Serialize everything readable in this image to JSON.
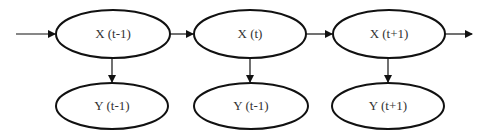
{
  "diagram": {
    "type": "dynamic-bayesian-network",
    "colors": {
      "stroke": "#111111",
      "text": "#333333",
      "background": "#ffffff"
    },
    "nodes": [
      {
        "id": "x_tm1",
        "label": "X (t-1)",
        "cx": 113,
        "cy": 34,
        "rx": 57,
        "ry": 24
      },
      {
        "id": "x_t",
        "label": "X (t)",
        "cx": 250,
        "cy": 34,
        "rx": 56,
        "ry": 24
      },
      {
        "id": "x_tp1",
        "label": "X (t+1)",
        "cx": 389,
        "cy": 34,
        "rx": 56,
        "ry": 24
      },
      {
        "id": "y_tm1",
        "label": "Y (t-1)",
        "cx": 112,
        "cy": 106,
        "rx": 56,
        "ry": 23
      },
      {
        "id": "y_t",
        "label": "Y (t-1)",
        "cx": 251,
        "cy": 106,
        "rx": 57,
        "ry": 23
      },
      {
        "id": "y_tp1",
        "label": "Y (t+1)",
        "cx": 388,
        "cy": 106,
        "rx": 56,
        "ry": 23
      }
    ],
    "edges": [
      {
        "from": "input",
        "to": "x_tm1"
      },
      {
        "from": "x_tm1",
        "to": "x_t"
      },
      {
        "from": "x_t",
        "to": "x_tp1"
      },
      {
        "from": "x_tp1",
        "to": "output"
      },
      {
        "from": "x_tm1",
        "to": "y_tm1"
      },
      {
        "from": "x_t",
        "to": "y_t"
      },
      {
        "from": "x_tp1",
        "to": "y_tp1"
      }
    ]
  }
}
